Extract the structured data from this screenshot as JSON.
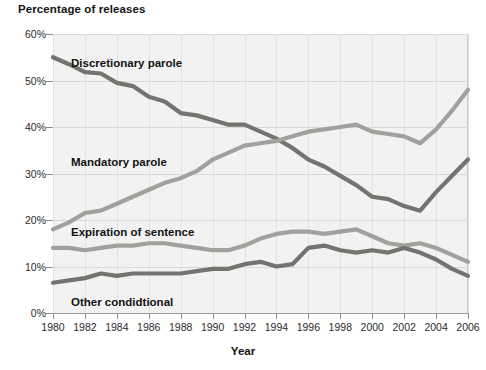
{
  "chart_data": {
    "type": "line",
    "title": "Percentage of releases",
    "xlabel": "Year",
    "ylabel": "Percentage of releases",
    "xlim": [
      1980,
      2006
    ],
    "ylim": [
      0,
      60
    ],
    "grid": true,
    "legend_position": "inline-annotations",
    "x": [
      1980,
      1981,
      1982,
      1983,
      1984,
      1985,
      1986,
      1987,
      1988,
      1989,
      1990,
      1991,
      1992,
      1993,
      1994,
      1995,
      1996,
      1997,
      1998,
      1999,
      2000,
      2001,
      2002,
      2003,
      2004,
      2005,
      2006
    ],
    "xticks": [
      "1980",
      "1982",
      "1984",
      "1986",
      "1988",
      "1990",
      "1992",
      "1994",
      "1996",
      "1998",
      "2000",
      "2002",
      "2004",
      "2006"
    ],
    "yticks": [
      "0%",
      "10%",
      "20%",
      "30%",
      "40%",
      "50%",
      "60%"
    ],
    "series": [
      {
        "name": "Discretionary parole",
        "color": "#73736f",
        "label_x": 71,
        "label_y": 57,
        "values": [
          55.0,
          53.5,
          51.8,
          51.5,
          49.5,
          48.8,
          46.5,
          45.5,
          43.0,
          42.5,
          41.5,
          40.5,
          40.5,
          39.0,
          37.5,
          35.5,
          33.0,
          31.5,
          29.5,
          27.5,
          25.0,
          24.5,
          23.0,
          22.0,
          26.0,
          29.5,
          33.0
        ]
      },
      {
        "name": "Mandatory parole",
        "color": "#a0a09c",
        "label_x": 71,
        "label_y": 156,
        "values": [
          18.0,
          19.5,
          21.5,
          22.0,
          23.5,
          25.0,
          26.5,
          28.0,
          29.0,
          30.5,
          33.0,
          34.5,
          36.0,
          36.5,
          37.0,
          38.0,
          39.0,
          39.5,
          40.0,
          40.5,
          39.0,
          38.5,
          38.0,
          36.5,
          39.5,
          43.5,
          48.0
        ]
      },
      {
        "name": "Expiration of sentence",
        "color": "#a0a09c",
        "label_x": 71,
        "label_y": 226,
        "values": [
          14.0,
          14.0,
          13.5,
          14.0,
          14.5,
          14.5,
          15.0,
          15.0,
          14.5,
          14.0,
          13.5,
          13.5,
          14.5,
          16.0,
          17.0,
          17.5,
          17.5,
          17.0,
          17.5,
          18.0,
          16.5,
          15.0,
          14.5,
          15.0,
          14.0,
          12.5,
          11.0
        ]
      },
      {
        "name": "Other condidtional",
        "color": "#73736f",
        "label_x": 71,
        "label_y": 296,
        "values": [
          6.5,
          7.0,
          7.5,
          8.5,
          8.0,
          8.5,
          8.5,
          8.5,
          8.5,
          9.0,
          9.5,
          9.5,
          10.5,
          11.0,
          10.0,
          10.5,
          14.0,
          14.5,
          13.5,
          13.0,
          13.5,
          13.0,
          14.0,
          13.0,
          11.5,
          9.5,
          8.0
        ]
      }
    ]
  }
}
